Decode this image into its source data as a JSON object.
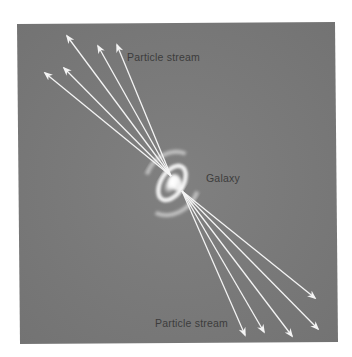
{
  "figure": {
    "background_color": "#7b7b7b",
    "page_color": "#ffffff",
    "arrow_color": "#f4f4f4",
    "label_color": "#3c3c3c"
  },
  "labels": {
    "top_stream": "Particle stream",
    "galaxy": "Galaxy",
    "bottom_stream": "Particle stream"
  },
  "streams": {
    "top": {
      "origin": [
        171,
        176
      ],
      "tips": [
        [
          67,
          36
        ],
        [
          98,
          46
        ],
        [
          117,
          45
        ],
        [
          45,
          73
        ],
        [
          64,
          68
        ]
      ]
    },
    "bottom": {
      "origin": [
        182,
        191
      ],
      "tips": [
        [
          245,
          335
        ],
        [
          264,
          332
        ],
        [
          292,
          336
        ],
        [
          318,
          329
        ],
        [
          315,
          298
        ]
      ]
    }
  },
  "galaxy": {
    "center": [
      172,
      183
    ],
    "rotation_deg": -58
  }
}
